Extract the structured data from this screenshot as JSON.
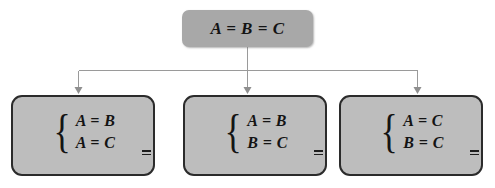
{
  "diagram": {
    "type": "tree",
    "colors": {
      "root_fill": "#a8a8a8",
      "leaf_fill": "#bdbdbd",
      "leaf_border": "#2b2b2b",
      "connector": "#9a9a9a",
      "text": "#141414",
      "background": "#ffffff"
    },
    "root": {
      "label": "A = B = C"
    },
    "brace_glyph": "{",
    "leaves": [
      {
        "id": "pair-ab-ac",
        "equations": [
          {
            "text": "A = B"
          },
          {
            "text": "A = C"
          }
        ]
      },
      {
        "id": "pair-ab-bc",
        "equations": [
          {
            "text": "A = B"
          },
          {
            "text": "B = C"
          }
        ]
      },
      {
        "id": "pair-ac-bc",
        "equations": [
          {
            "text": "A = C"
          },
          {
            "text": "B = C"
          }
        ]
      }
    ]
  }
}
